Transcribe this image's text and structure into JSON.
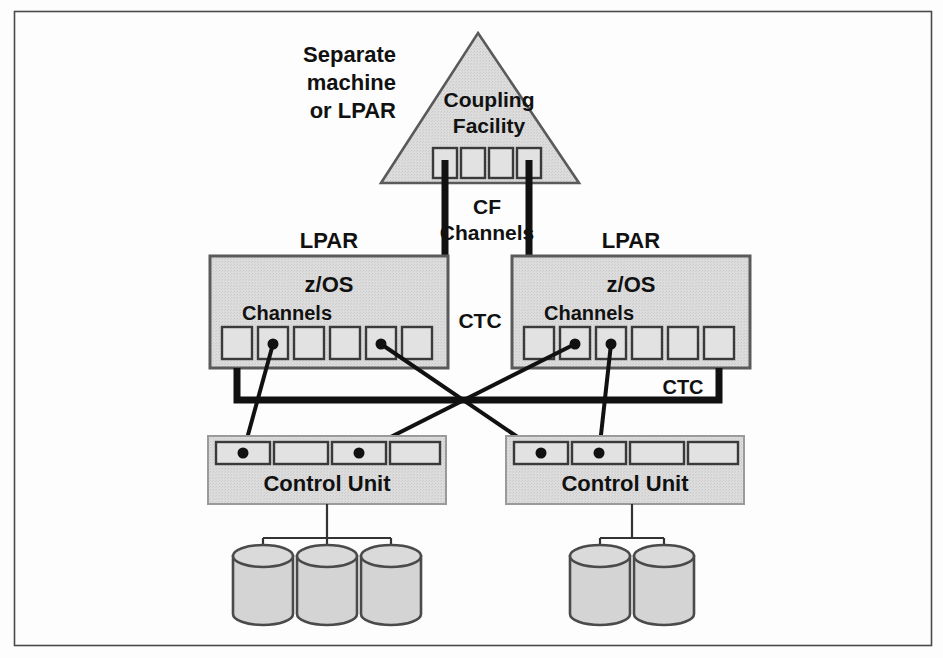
{
  "figure": {
    "frame": {
      "stroke": "#4a4a4a",
      "fill": "#fdfdfd"
    },
    "colors": {
      "box_fill": "#d9d9d9",
      "box_stroke": "#5a5a5a",
      "port_fill": "#e2e2e2",
      "line": "#111111",
      "thick_line": "#111111",
      "disk_fill": "#d4d4d4",
      "text": "#111111"
    }
  },
  "labels": {
    "separate_machine": {
      "line1": "Separate",
      "line2": "machine",
      "line3": "or LPAR"
    },
    "coupling_facility": {
      "line1": "Coupling",
      "line2": "Facility"
    },
    "cf_channels": {
      "line1": "CF",
      "line2": "Channels"
    },
    "lpar_left": "LPAR",
    "lpar_right": "LPAR",
    "zos_left": "z/OS",
    "zos_right": "z/OS",
    "channels_left": "Channels",
    "channels_right": "Channels",
    "ctc_center": "CTC",
    "ctc_right": "CTC",
    "control_unit_left": "Control Unit",
    "control_unit_right": "Control Unit"
  },
  "coupling_facility": {
    "apex": {
      "x": 478,
      "y": 33
    },
    "base_left": {
      "x": 381,
      "y": 183
    },
    "base_right": {
      "x": 579,
      "y": 183
    },
    "channel_count": 4,
    "channel_ports": [
      {
        "index": 0,
        "x": 433,
        "y": 148,
        "w": 24,
        "h": 30,
        "connected": true
      },
      {
        "index": 1,
        "x": 461,
        "y": 148,
        "w": 24,
        "h": 30,
        "connected": false
      },
      {
        "index": 2,
        "x": 489,
        "y": 148,
        "w": 24,
        "h": 30,
        "connected": false
      },
      {
        "index": 3,
        "x": 517,
        "y": 148,
        "w": 24,
        "h": 30,
        "connected": true
      }
    ]
  },
  "lpars": [
    {
      "id": "left",
      "label": "LPAR",
      "os": "z/OS",
      "channels_label": "Channels",
      "box": {
        "x": 210,
        "y": 256,
        "w": 238,
        "h": 112
      },
      "channel_count": 6,
      "channel_ports": [
        {
          "index": 0,
          "x": 222,
          "y": 327,
          "w": 30,
          "h": 32,
          "connected": true
        },
        {
          "index": 1,
          "x": 258,
          "y": 327,
          "w": 30,
          "h": 32,
          "connected": true
        },
        {
          "index": 2,
          "x": 294,
          "y": 327,
          "w": 30,
          "h": 32,
          "connected": false
        },
        {
          "index": 3,
          "x": 330,
          "y": 327,
          "w": 30,
          "h": 32,
          "connected": false
        },
        {
          "index": 4,
          "x": 366,
          "y": 327,
          "w": 30,
          "h": 32,
          "connected": true
        },
        {
          "index": 5,
          "x": 402,
          "y": 327,
          "w": 30,
          "h": 32,
          "connected": true
        }
      ]
    },
    {
      "id": "right",
      "label": "LPAR",
      "os": "z/OS",
      "channels_label": "Channels",
      "box": {
        "x": 512,
        "y": 256,
        "w": 238,
        "h": 112
      },
      "channel_count": 6,
      "channel_ports": [
        {
          "index": 0,
          "x": 524,
          "y": 327,
          "w": 30,
          "h": 32,
          "connected": true
        },
        {
          "index": 1,
          "x": 560,
          "y": 327,
          "w": 30,
          "h": 32,
          "connected": true
        },
        {
          "index": 2,
          "x": 596,
          "y": 327,
          "w": 30,
          "h": 32,
          "connected": true
        },
        {
          "index": 3,
          "x": 632,
          "y": 327,
          "w": 30,
          "h": 32,
          "connected": false
        },
        {
          "index": 4,
          "x": 668,
          "y": 327,
          "w": 30,
          "h": 32,
          "connected": false
        },
        {
          "index": 5,
          "x": 704,
          "y": 327,
          "w": 30,
          "h": 32,
          "connected": false
        }
      ]
    }
  ],
  "control_units": [
    {
      "id": "left",
      "label": "Control Unit",
      "box": {
        "x": 208,
        "y": 436,
        "w": 238,
        "h": 68
      },
      "port_count": 4,
      "ports": [
        {
          "index": 0,
          "x": 216,
          "y": 442,
          "w": 54,
          "h": 22,
          "connected": true
        },
        {
          "index": 1,
          "x": 274,
          "y": 442,
          "w": 54,
          "h": 22,
          "connected": false
        },
        {
          "index": 2,
          "x": 332,
          "y": 442,
          "w": 54,
          "h": 22,
          "connected": true
        },
        {
          "index": 3,
          "x": 390,
          "y": 442,
          "w": 50,
          "h": 22,
          "connected": false
        }
      ],
      "disk_count": 3
    },
    {
      "id": "right",
      "label": "Control Unit",
      "box": {
        "x": 506,
        "y": 436,
        "w": 238,
        "h": 68
      },
      "port_count": 4,
      "ports": [
        {
          "index": 0,
          "x": 514,
          "y": 442,
          "w": 54,
          "h": 22,
          "connected": true
        },
        {
          "index": 1,
          "x": 572,
          "y": 442,
          "w": 54,
          "h": 22,
          "connected": true
        },
        {
          "index": 2,
          "x": 630,
          "y": 442,
          "w": 54,
          "h": 22,
          "connected": false
        },
        {
          "index": 3,
          "x": 688,
          "y": 442,
          "w": 50,
          "h": 22,
          "connected": false
        }
      ],
      "disk_count": 2
    }
  ],
  "disks": {
    "left_group": [
      {
        "cx": 263,
        "cy": 586
      },
      {
        "cx": 327,
        "cy": 586
      },
      {
        "cx": 391,
        "cy": 586
      }
    ],
    "right_group": [
      {
        "cx": 600,
        "cy": 586
      },
      {
        "cx": 664,
        "cy": 586
      }
    ],
    "rx": 30,
    "ry": 11,
    "body_height": 58
  },
  "connections": {
    "cf_links": [
      {
        "from": "cf.port.0",
        "to": "lpar.left.channel.5",
        "style": "thick"
      },
      {
        "from": "cf.port.3",
        "to": "lpar.right.channel.0",
        "style": "thick"
      }
    ],
    "ctc_link": {
      "from": "lpar.left.channel.0",
      "to": "lpar.right.channel.5",
      "style": "thick",
      "label": "CTC"
    },
    "channel_to_cu": [
      {
        "from": "lpar.left.channel.1",
        "to": "cu.left.port.0",
        "style": "thin"
      },
      {
        "from": "lpar.left.channel.4",
        "to": "cu.right.port.0",
        "style": "thin"
      },
      {
        "from": "lpar.right.channel.1",
        "to": "cu.left.port.2",
        "style": "thin"
      },
      {
        "from": "lpar.right.channel.2",
        "to": "cu.right.port.1",
        "style": "thin"
      }
    ]
  }
}
